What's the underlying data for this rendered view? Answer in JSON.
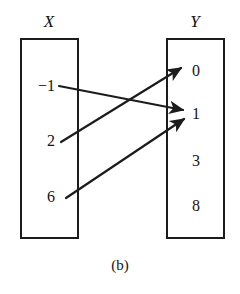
{
  "figure": {
    "caption": "(b)",
    "ink_color": "#1c1c1c",
    "background_color": "#ffffff"
  },
  "domain_set": {
    "label": "X",
    "elements": [
      {
        "value": "−1",
        "x": 55,
        "y": 86
      },
      {
        "value": "2",
        "x": 55,
        "y": 141
      },
      {
        "value": "6",
        "x": 55,
        "y": 197
      }
    ]
  },
  "codomain_set": {
    "label": "Y",
    "elements": [
      {
        "value": "0",
        "x": 192,
        "y": 71
      },
      {
        "value": "1",
        "x": 192,
        "y": 114
      },
      {
        "value": "3",
        "x": 192,
        "y": 161
      },
      {
        "value": "8",
        "x": 192,
        "y": 206
      }
    ]
  },
  "chart_data": {
    "type": "diagram",
    "title": "(b)",
    "diagram_kind": "arrow-diagram",
    "sets": [
      {
        "name": "X",
        "role": "domain",
        "members": [
          "−1",
          "2",
          "6"
        ]
      },
      {
        "name": "Y",
        "role": "codomain",
        "members": [
          "0",
          "1",
          "3",
          "8"
        ]
      }
    ],
    "mappings": [
      {
        "from": "−1",
        "to": "1"
      },
      {
        "from": "2",
        "to": "0"
      },
      {
        "from": "6",
        "to": "1"
      }
    ],
    "unmapped_codomain_members": [
      "3",
      "8"
    ]
  },
  "arrows": [
    {
      "name": "arrow-neg1-to-1",
      "from": "−1",
      "to": "1",
      "x1": 59,
      "y1": 86,
      "x2": 183,
      "y2": 110
    },
    {
      "name": "arrow-2-to-0",
      "from": "2",
      "to": "0",
      "x1": 61,
      "y1": 142,
      "x2": 181,
      "y2": 68
    },
    {
      "name": "arrow-6-to-1",
      "from": "6",
      "to": "1",
      "x1": 66,
      "y1": 198,
      "x2": 184,
      "y2": 119
    }
  ]
}
